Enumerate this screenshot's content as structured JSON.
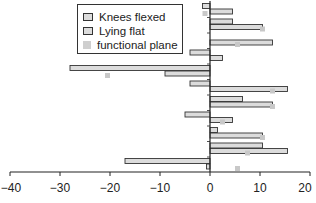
{
  "chart_data": {
    "type": "bar",
    "orientation": "horizontal",
    "title": "",
    "xlabel": "",
    "ylabel": "",
    "xlim": [
      -40,
      20
    ],
    "x_ticks": [
      -40,
      -30,
      -20,
      -10,
      0,
      10,
      20
    ],
    "x_tick_labels": [
      "−40",
      "−30",
      "−20",
      "−10",
      "0",
      "10",
      "20"
    ],
    "grid": false,
    "legend_position": "upper-left-inside",
    "categories": [
      "1",
      "2",
      "3",
      "4",
      "5",
      "6",
      "7",
      "8",
      "9",
      "10",
      "11"
    ],
    "series": [
      {
        "name": "Knees flexed",
        "kind": "bar",
        "values": [
          -1.5,
          4.5,
          0,
          -4,
          -28,
          -4,
          6.5,
          -5,
          1.5,
          10.5,
          -17
        ]
      },
      {
        "name": "Lying flat",
        "kind": "bar",
        "values": [
          4.5,
          10.5,
          12.5,
          2.5,
          -9,
          15.5,
          12.5,
          4.5,
          10.5,
          15.5,
          -0.7
        ]
      },
      {
        "name": "functional plane",
        "kind": "marker",
        "values": [
          -1,
          10.5,
          5.5,
          null,
          -20.5,
          12.5,
          12.5,
          2.5,
          10.5,
          7.5,
          5.5
        ]
      }
    ]
  },
  "legend": {
    "items": [
      {
        "label": "Knees flexed"
      },
      {
        "label": "Lying flat"
      },
      {
        "label": "functional plane"
      }
    ]
  },
  "colors": {
    "bar_fill": "#dcdcdc",
    "bar_stroke": "#333333",
    "marker": "#c8c8c8",
    "axis": "#222222"
  }
}
